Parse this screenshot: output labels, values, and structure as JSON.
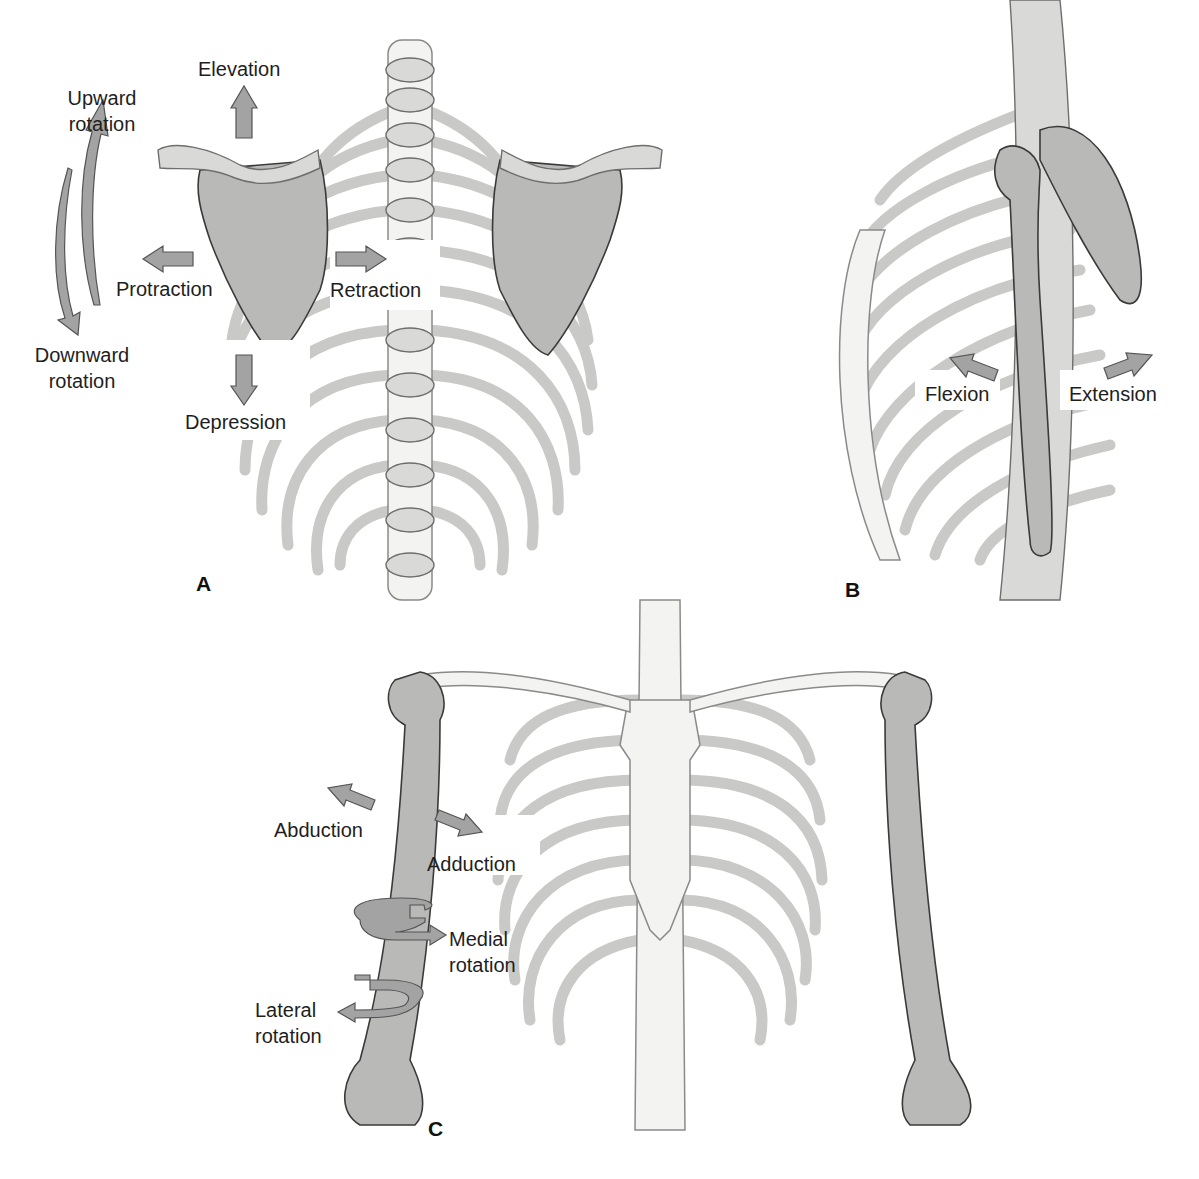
{
  "figure": {
    "panels": [
      {
        "id": "A",
        "letter": "A",
        "view": "posterior view of thorax with scapulae",
        "labels": {
          "elevation": "Elevation",
          "upward_rotation_line1": "Upward",
          "upward_rotation_line2": "rotation",
          "downward_rotation_line1": "Downward",
          "downward_rotation_line2": "rotation",
          "protraction": "Protraction",
          "retraction": "Retraction",
          "depression": "Depression"
        },
        "arrows": [
          "arrow-up-elevation",
          "arrow-left-protraction",
          "arrow-right-retraction",
          "arrow-down-depression",
          "curved-arrow-upward-rotation",
          "curved-arrow-downward-rotation"
        ]
      },
      {
        "id": "B",
        "letter": "B",
        "view": "lateral view of thorax with humerus",
        "labels": {
          "flexion": "Flexion",
          "extension": "Extension"
        },
        "arrows": [
          "arrow-flexion",
          "arrow-extension"
        ]
      },
      {
        "id": "C",
        "letter": "C",
        "view": "anterior view of thorax with humeri",
        "labels": {
          "abduction": "Abduction",
          "adduction": "Adduction",
          "medial_rotation_line1": "Medial",
          "medial_rotation_line2": "rotation",
          "lateral_rotation_line1": "Lateral",
          "lateral_rotation_line2": "rotation"
        },
        "arrows": [
          "arrow-abduction",
          "arrow-adduction",
          "circular-arrow-medial-rotation",
          "circular-arrow-lateral-rotation"
        ]
      }
    ]
  },
  "colors": {
    "background": "#ffffff",
    "bone_light": "#f3f3f1",
    "bone_dark": "#b9b9b7",
    "arrow_fill": "#a3a3a3",
    "text": "#1e1e1e"
  }
}
